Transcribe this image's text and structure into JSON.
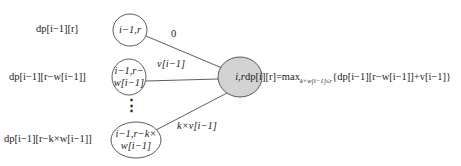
{
  "nodes": [
    {
      "id": "n1",
      "label_line1": "i−1,r",
      "label_line2": "",
      "state_label": "dp[i−1][r]"
    },
    {
      "id": "n2",
      "label_line1": "i−1,r−",
      "label_line2": "w[i−1]",
      "state_label": "dp[i−1][r−w[i−1]]"
    },
    {
      "id": "n3",
      "label_line1": "i−1,r−k×",
      "label_line2": "w[i−1]",
      "state_label": "dp[i−1][r−k×w[i−1]]"
    },
    {
      "id": "target",
      "label_line1": "i,r",
      "label_line2": "",
      "state_label": ""
    }
  ],
  "ellipsis": "⋮",
  "edges": [
    {
      "from": "n1",
      "to": "target",
      "label": "0"
    },
    {
      "from": "n2",
      "to": "target",
      "label": "v[i−1]"
    },
    {
      "from": "n3",
      "to": "target",
      "label": "k×v[i−1]"
    }
  ],
  "formula": {
    "lhs": "dp[i][r]=max",
    "subscript": "k×w[i−1]≤r",
    "rhs": "{dp[i−1][r−w[i−1]]+v[i−1]}"
  },
  "colors": {
    "line": "#333333",
    "target_fill": "#d3d3d3",
    "node_fill": "#ffffff"
  }
}
